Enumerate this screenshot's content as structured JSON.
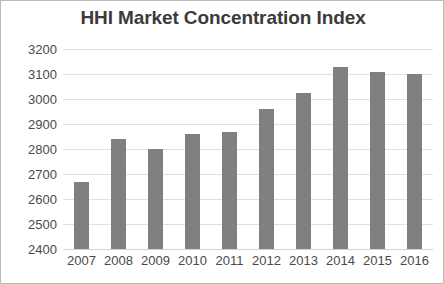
{
  "chart_data": {
    "type": "bar",
    "title": "HHI Market Concentration Index",
    "xlabel": "",
    "ylabel": "",
    "categories": [
      "2007",
      "2008",
      "2009",
      "2010",
      "2011",
      "2012",
      "2013",
      "2014",
      "2015",
      "2016"
    ],
    "values": [
      2670,
      2840,
      2800,
      2860,
      2870,
      2960,
      3025,
      3130,
      3110,
      3100
    ],
    "series": [
      {
        "name": "HHI",
        "values": [
          2670,
          2840,
          2800,
          2860,
          2870,
          2960,
          3025,
          3130,
          3110,
          3100
        ]
      }
    ],
    "ylim": [
      2400,
      3200
    ],
    "ytick_step": 100,
    "yticks": [
      2400,
      2500,
      2600,
      2700,
      2800,
      2900,
      3000,
      3100,
      3200
    ],
    "ytick_labels": [
      "2400",
      "2500",
      "2600",
      "2700",
      "2800",
      "2900",
      "3000",
      "3100",
      "3200"
    ],
    "grid": "horizontal",
    "legend": "none",
    "bar_color": "#808080",
    "gridline_color": "#e0e0e0",
    "background_color": "#ffffff",
    "title_color": "#3b3b3b",
    "tick_label_color": "#4a4a4a",
    "border_color": "#b9b9b9"
  }
}
